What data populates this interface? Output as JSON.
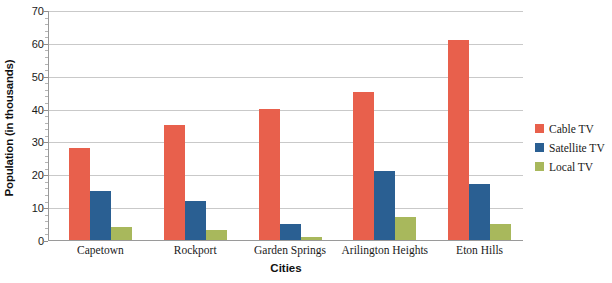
{
  "chart_data": {
    "type": "bar",
    "title": "",
    "xlabel": "Cities",
    "ylabel": "Population (in thousands)",
    "ylim": [
      0,
      70
    ],
    "ytick_step": 10,
    "yticks": [
      0,
      10,
      20,
      30,
      40,
      50,
      60,
      70
    ],
    "grid": true,
    "legend_position": "right",
    "categories": [
      "Capetown",
      "Rockport",
      "Garden Springs",
      "Arilington Heights",
      "Eton Hills"
    ],
    "series": [
      {
        "name": "Cable TV",
        "color": "#e8604c",
        "values": [
          28,
          35,
          40,
          45,
          61
        ]
      },
      {
        "name": "Satellite TV",
        "color": "#2a5f92",
        "values": [
          15,
          12,
          5,
          21,
          17
        ]
      },
      {
        "name": "Local TV",
        "color": "#a8b85c",
        "values": [
          4,
          3,
          1,
          7,
          5
        ]
      }
    ]
  },
  "colors": {
    "cable_tv": "#e8604c",
    "satellite_tv": "#2a5f92",
    "local_tv": "#a8b85c",
    "gridline": "#c9c9c9",
    "axis": "#9a9a9a",
    "background": "#ffffff",
    "text": "#1a1a1a"
  }
}
